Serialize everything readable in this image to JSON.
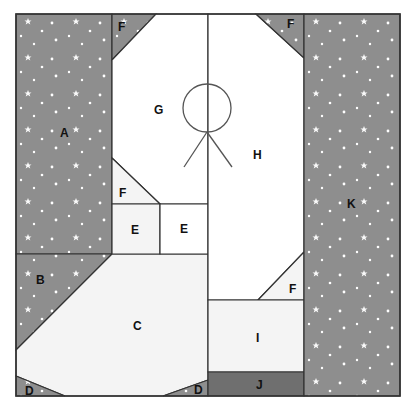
{
  "diagram": {
    "colors": {
      "starry_fabric": "#8e8e8e",
      "dark_fabric": "#6f6f6f",
      "light_fabric": "#f4f4f4",
      "white": "#ffffff",
      "outline": "#333333",
      "star": "#ffffff"
    },
    "pieces": [
      {
        "id": "A",
        "label": "A",
        "fabric": "starry"
      },
      {
        "id": "B",
        "label": "B",
        "fabric": "starry"
      },
      {
        "id": "C",
        "label": "C",
        "fabric": "light"
      },
      {
        "id": "D-left",
        "label": "D",
        "fabric": "starry"
      },
      {
        "id": "D-right",
        "label": "D",
        "fabric": "starry"
      },
      {
        "id": "E-left",
        "label": "E",
        "fabric": "light"
      },
      {
        "id": "E-right",
        "label": "E",
        "fabric": "white"
      },
      {
        "id": "F-top-left",
        "label": "F",
        "fabric": "starry"
      },
      {
        "id": "F-top-right",
        "label": "F",
        "fabric": "starry"
      },
      {
        "id": "F-mid-left",
        "label": "F",
        "fabric": "light"
      },
      {
        "id": "F-mid-right",
        "label": "F",
        "fabric": "light"
      },
      {
        "id": "G",
        "label": "G",
        "fabric": "white"
      },
      {
        "id": "H",
        "label": "H",
        "fabric": "white"
      },
      {
        "id": "I",
        "label": "I",
        "fabric": "light"
      },
      {
        "id": "J",
        "label": "J",
        "fabric": "dark"
      },
      {
        "id": "K",
        "label": "K",
        "fabric": "starry"
      }
    ],
    "labels": {
      "A": "A",
      "B": "B",
      "C": "C",
      "D": "D",
      "E": "E",
      "F": "F",
      "G": "G",
      "H": "H",
      "I": "I",
      "J": "J",
      "K": "K"
    },
    "embroidery": "stick figure (circle head with legs) on center seam"
  }
}
